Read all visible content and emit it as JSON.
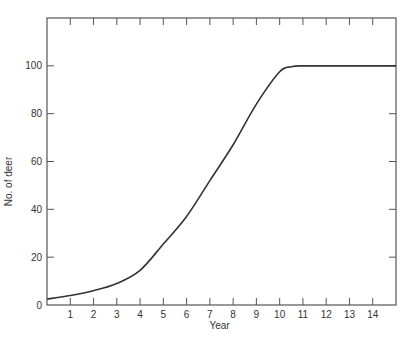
{
  "chart_data": {
    "type": "line",
    "title": "",
    "xlabel": "Year",
    "ylabel": "No. of deer",
    "xlim": [
      0,
      15
    ],
    "ylim": [
      0,
      120
    ],
    "x_ticks": [
      1,
      2,
      3,
      4,
      5,
      6,
      7,
      8,
      9,
      10,
      11,
      12,
      13,
      14
    ],
    "x_tick_labels": [
      "1",
      "2",
      "3",
      "4",
      "5",
      "6",
      "7",
      "8",
      "9",
      "10",
      "11",
      "12",
      "13",
      "14"
    ],
    "y_ticks": [
      0,
      20,
      40,
      60,
      80,
      100
    ],
    "y_tick_labels": [
      "0",
      "20",
      "40",
      "60",
      "80",
      "100"
    ],
    "grid": false,
    "legend": null,
    "series": [
      {
        "name": "Deer population",
        "color": "#333333",
        "x": [
          0,
          1,
          2,
          3,
          4,
          5,
          6,
          7,
          8,
          9,
          10,
          10.5,
          11,
          12,
          13,
          14,
          15
        ],
        "y": [
          2.5,
          4,
          6,
          9,
          14.5,
          25.5,
          37,
          52,
          67,
          84,
          97.5,
          99.6,
          100,
          100,
          100,
          100,
          100
        ]
      }
    ]
  }
}
